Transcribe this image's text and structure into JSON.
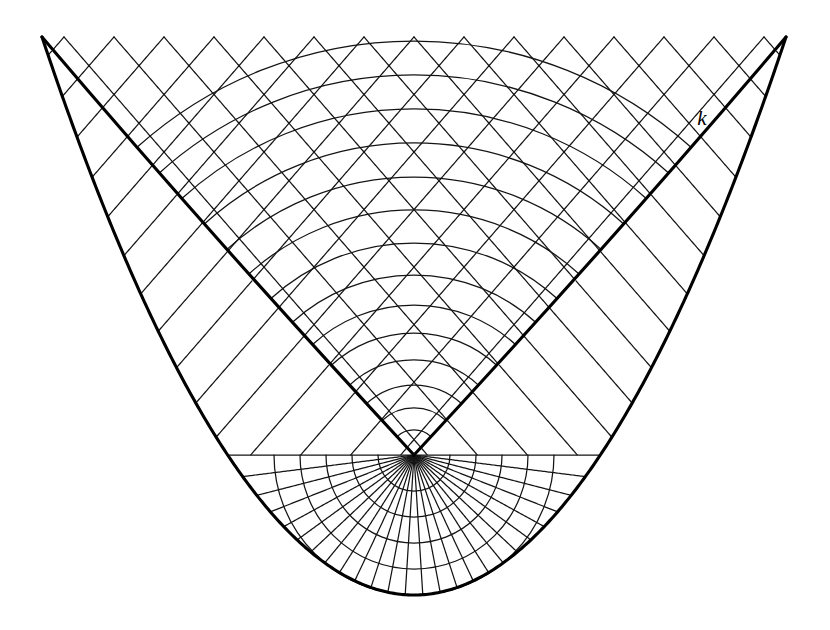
{
  "figure": {
    "background_color": "#ffffff",
    "line_color": "#141414",
    "bold_color": "#000000",
    "width": 830,
    "height": 630
  },
  "labels": [
    {
      "text": "k",
      "x": 702,
      "y": 120,
      "name": "caustic-label-k"
    }
  ],
  "chart_data": {
    "type": "line",
    "xlabel": "",
    "ylabel": "",
    "grid": false,
    "legend": "none",
    "xlim": [
      0,
      830
    ],
    "ylim": [
      0,
      630
    ],
    "geometry": {
      "cusp_point": {
        "x": 414,
        "y": 455
      },
      "top_edge_y": 37,
      "left_apex": {
        "x": 42,
        "y": 37
      },
      "right_apex": {
        "x": 786,
        "y": 37
      },
      "bottom_vertex": {
        "x": 414,
        "y": 595
      },
      "ray_half_angle_deg": 41,
      "ray_spacing_px": 50,
      "ray_count_per_family": 17,
      "wavefront_center": {
        "x": 414,
        "y": 455
      },
      "wavefront_radii": [
        25,
        47,
        70,
        95,
        122,
        150,
        180,
        212,
        245,
        278,
        312,
        346,
        380,
        414
      ],
      "lower_arc_radii": [
        36,
        62,
        90,
        118,
        143
      ],
      "radial_fan_count": 25,
      "outer_envelope_control": {
        "x": 414,
        "y": 880
      },
      "caustic_envelope_sag_px": 14
    },
    "annotations": [
      {
        "label": "k",
        "x": 702,
        "y": 120,
        "describes": "outer envelope curve"
      }
    ],
    "series": [
      {
        "name": "wavefront-arcs",
        "kind": "concentric-circular-arcs",
        "count": 14
      },
      {
        "name": "lower-wavefront-arcs",
        "kind": "concentric-circular-arcs",
        "count": 5
      },
      {
        "name": "rays-left-family",
        "kind": "parallel-straight-lines",
        "count": 17
      },
      {
        "name": "rays-right-family",
        "kind": "parallel-straight-lines",
        "count": 17
      },
      {
        "name": "radial-fan",
        "kind": "radial-straight-lines",
        "count": 25
      },
      {
        "name": "caustic-edge",
        "kind": "bold-v-envelope",
        "count": 2
      },
      {
        "name": "outer-envelope",
        "kind": "bold-parabola",
        "count": 1
      }
    ]
  }
}
